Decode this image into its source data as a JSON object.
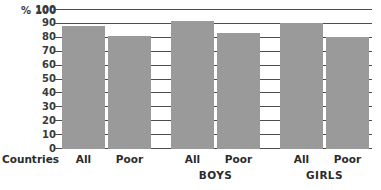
{
  "chart_data": {
    "type": "bar",
    "title": "",
    "xlabel": "",
    "ylabel": "% 100",
    "unit_label": "%",
    "ylim": [
      0,
      100
    ],
    "ytick_step": 10,
    "yticks": [
      0,
      10,
      20,
      30,
      40,
      50,
      60,
      70,
      80,
      90,
      100
    ],
    "ytick_labels": [
      "0",
      "10",
      "20",
      "30",
      "40",
      "50",
      "60",
      "70",
      "80",
      "90",
      "100"
    ],
    "grid": true,
    "legend": "none",
    "group_row_label": "Countries",
    "categories": [
      "All",
      "Poor",
      "All",
      "Poor",
      "All",
      "Poor"
    ],
    "groups": [
      {
        "name": "",
        "categories": [
          "All",
          "Poor"
        ],
        "values": [
          88,
          81
        ]
      },
      {
        "name": "BOYS",
        "categories": [
          "All",
          "Poor"
        ],
        "values": [
          92,
          83
        ]
      },
      {
        "name": "GIRLS",
        "categories": [
          "All",
          "Poor"
        ],
        "values": [
          90,
          80
        ]
      }
    ],
    "series": [
      {
        "name": "Percent",
        "values": [
          88,
          81,
          92,
          83,
          90,
          80
        ]
      }
    ],
    "bar_color": "#9a9a9a",
    "grid_color": "#4d4d4d",
    "text_color": "#2b2b2b",
    "background_color": "#ffffff"
  },
  "axis": {
    "unit": "% 100"
  }
}
